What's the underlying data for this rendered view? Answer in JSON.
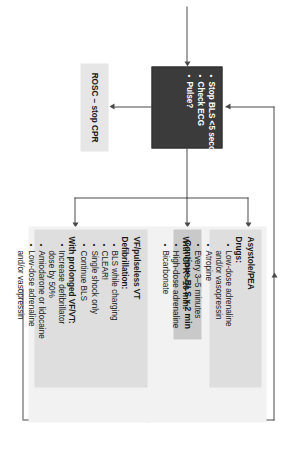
{
  "diagram": {
    "orientation": "rotated-90-clockwise",
    "colors": {
      "decision_box": "#3b3b3b",
      "decision_text": "#ffffff",
      "process_box": "#c9c9c9",
      "terminal_box": "#e6e6e6",
      "panel_box": "#dedede",
      "panel_backdrop": "#f2f2f2",
      "connector": "#4a4a4a"
    }
  },
  "decision": {
    "name": "Stop BLS / Check ECG / Pulse",
    "items": [
      "Stop BLS <5 seconds!",
      "Check ECG",
      "Pulse?"
    ]
  },
  "rosc": {
    "label": "ROSC – stop CPR"
  },
  "continue_bls": {
    "label": "Continue BLS x 2 min"
  },
  "asystole": {
    "title": "Asystole/PEA",
    "drugs_heading": "Drugs:",
    "drugs": [
      {
        "text": "Low-dose adrenaline",
        "cont": "and/or vasopressin"
      },
      {
        "text": "Atropine",
        "cont": ""
      },
      {
        "text": "Every 3–5 minutes",
        "cont": ""
      }
    ],
    "cpr_heading": "With CPR >10 min:",
    "cpr_items": [
      {
        "text": "High-dose adrenaline",
        "cont": ""
      },
      {
        "text": "Bicarbonate",
        "cont": ""
      }
    ]
  },
  "vf": {
    "title": "VF/pulseless VT",
    "defib_heading": "Defibrillation:",
    "defib_items": [
      {
        "text": "BLS while charging",
        "cont": ""
      },
      {
        "text": "CLEAR!",
        "cont": ""
      },
      {
        "text": "Single shock only",
        "cont": ""
      },
      {
        "text": "Continue BLS",
        "cont": ""
      }
    ],
    "prolonged_heading": "With prolonged VF/VT:",
    "prolonged_items": [
      {
        "text": "Increase defibrillator",
        "cont": "dose by 50%"
      },
      {
        "text": "Amiodarone or lidocaine",
        "cont": ""
      },
      {
        "text": "Low-dose adrenaline",
        "cont": "and/or vasopressin"
      }
    ]
  }
}
